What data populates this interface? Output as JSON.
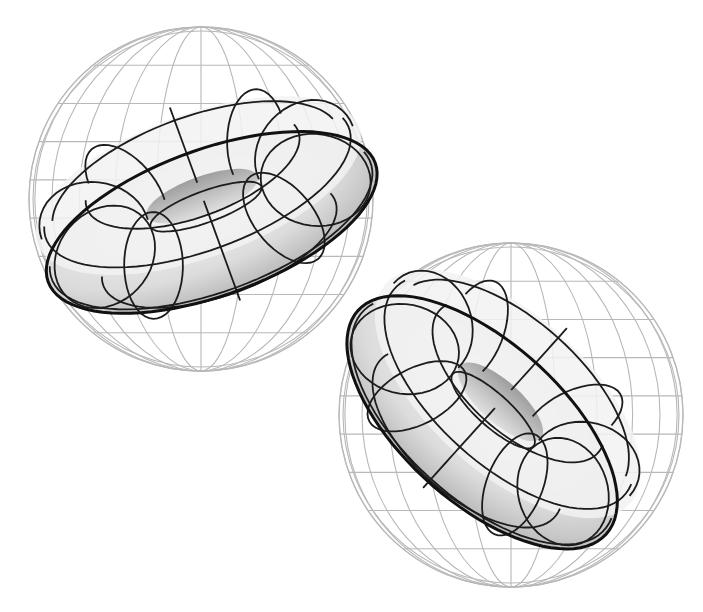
{
  "figure": {
    "colors": {
      "background": "#ffffff",
      "sphere_grid": "#b8b8b8",
      "torus_lines": "#1c1c1c",
      "torus_shade_light": "#f4f4f4",
      "torus_shade_dark": "#b0b0b0"
    },
    "panels": [
      {
        "name": "torus-upper-left",
        "sphere": {
          "cx": 201,
          "cy": 199,
          "r": 172,
          "latitudes": 9,
          "meridians": 12
        },
        "torus": {
          "cx": 205,
          "cy": 204,
          "R": 118,
          "r": 56,
          "rotate": -20,
          "tilt": 0.42
        }
      },
      {
        "name": "torus-lower-right",
        "sphere": {
          "cx": 511,
          "cy": 415,
          "r": 172,
          "latitudes": 9,
          "meridians": 12
        },
        "torus": {
          "cx": 495,
          "cy": 408,
          "R": 112,
          "r": 55,
          "rotate": 42,
          "tilt": 0.48
        }
      }
    ]
  }
}
